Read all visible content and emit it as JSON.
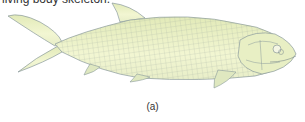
{
  "clipped_text": "living body skeleton.",
  "figure": {
    "caption": "(a)",
    "colors": {
      "body_fill": "#eef2c8",
      "belly_fill": "#f4f7d6",
      "outline": "#8a9a9c",
      "scale_lines": "#9aa8a0",
      "head_fill": "#e8efc4"
    }
  }
}
